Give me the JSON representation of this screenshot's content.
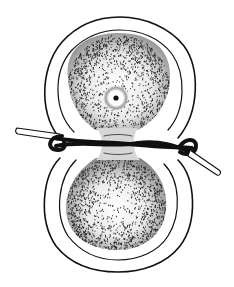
{
  "figure": {
    "style": "stippled pen-and-ink illustration",
    "colors": {
      "background": "#ffffff",
      "ink": "#111111"
    },
    "upper_half": {
      "outer_envelope": {
        "cx": 118,
        "top": 17,
        "left": 41,
        "right": 196
      },
      "inner_envelope": {
        "cx": 118,
        "top": 30,
        "left": 54,
        "right": 183
      },
      "yolk_mass": {
        "cx": 118,
        "cy": 92,
        "rx": 52,
        "ry": 52
      },
      "dark_spot": {
        "cx": 116,
        "cy": 98,
        "r": 3
      }
    },
    "lower_half": {
      "outer_envelope": {
        "cx": 118,
        "bottom": 272,
        "left": 42,
        "right": 193
      },
      "inner_envelope": {
        "cx": 118,
        "bottom": 260,
        "left": 55,
        "right": 180
      },
      "yolk_mass": {
        "cx": 116,
        "cy": 205,
        "rx": 50,
        "ry": 44
      }
    },
    "ligature": {
      "description": "twisted hair loop tied around the constriction",
      "left_end": {
        "x": 16,
        "y": 131
      },
      "right_end": {
        "x": 220,
        "y": 175
      },
      "knot": {
        "x": 190,
        "y": 150
      }
    }
  }
}
